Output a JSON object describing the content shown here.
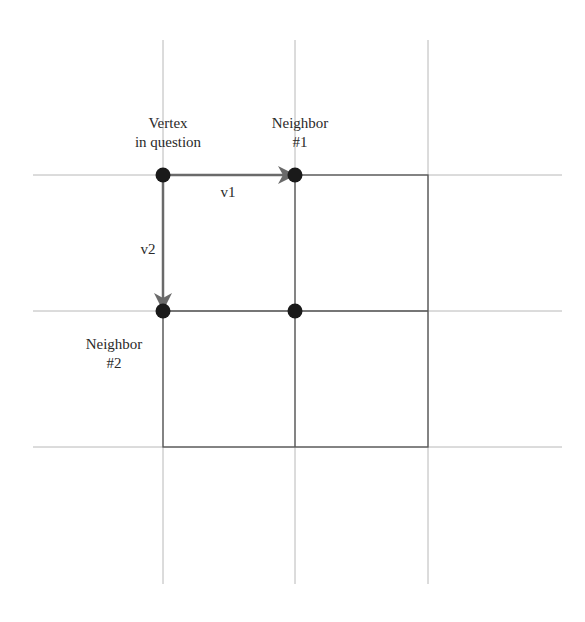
{
  "diagram": {
    "labels": {
      "vertex": "Vertex\nin question",
      "neighbor1": "Neighbor\n#1",
      "neighbor2": "Neighbor\n#2",
      "v1": "v1",
      "v2": "v2"
    },
    "grid": {
      "x_lines": [
        163,
        295,
        428
      ],
      "y_lines": [
        175,
        311,
        447
      ],
      "x_extent": [
        33,
        562
      ],
      "y_extent": [
        40,
        584
      ]
    },
    "nodes": [
      {
        "id": "vertex",
        "x": 163,
        "y": 175
      },
      {
        "id": "neighbor1",
        "x": 295,
        "y": 175
      },
      {
        "id": "neighbor2",
        "x": 163,
        "y": 311
      },
      {
        "id": "diagonal",
        "x": 295,
        "y": 311
      }
    ],
    "vectors": [
      {
        "id": "v1",
        "from": "vertex",
        "to": "neighbor1"
      },
      {
        "id": "v2",
        "from": "vertex",
        "to": "neighbor2"
      }
    ],
    "colors": {
      "grid_line": "#b8b8b8",
      "cell_line": "#555555",
      "node": "#1a1a1a",
      "arrow": "#6a6a6a",
      "text": "#2a2a2a"
    }
  }
}
